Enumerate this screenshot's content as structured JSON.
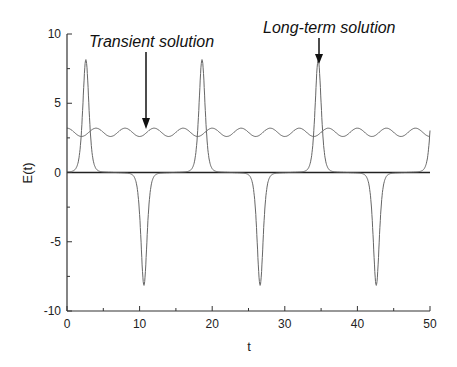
{
  "chart_data": {
    "type": "line",
    "title": "",
    "xlabel": "t",
    "ylabel": "E(t)",
    "xlim": [
      0,
      50
    ],
    "ylim": [
      -10,
      10
    ],
    "x_ticks": [
      0,
      10,
      20,
      30,
      40,
      50
    ],
    "y_ticks": [
      -10,
      -5,
      0,
      5,
      10
    ],
    "x_tick_labels": [
      "0",
      "10",
      "20",
      "30",
      "40",
      "50"
    ],
    "y_tick_labels": [
      "-10",
      "-5",
      "0",
      "5",
      "10"
    ],
    "grid": false,
    "legend": null,
    "series": [
      {
        "name": "Long-term solution",
        "description": "Periodic pulse train: sharp positive peaks (~7.9) and sharp negative troughs (~-7.9), near zero in between",
        "period": 16,
        "peaks": [
          {
            "t": 2.6,
            "E": 7.9
          },
          {
            "t": 18.6,
            "E": 7.9
          },
          {
            "t": 34.6,
            "E": 7.9
          }
        ],
        "troughs": [
          {
            "t": 10.6,
            "E": -7.9
          },
          {
            "t": 26.6,
            "E": -7.9
          },
          {
            "t": 42.6,
            "E": -7.9
          }
        ],
        "end_value": {
          "t": 50,
          "E": 7.0
        }
      },
      {
        "name": "Transient solution",
        "description": "Small sinusoidal oscillation around ~2.9 with amplitude ~0.3",
        "mean": 2.9,
        "amplitude": 0.3,
        "period": 4,
        "start_value": {
          "t": 0,
          "E": 3.2
        }
      },
      {
        "name": "Zero line",
        "description": "Horizontal baseline at E=0",
        "value": 0
      }
    ],
    "annotations": [
      {
        "text": "Transient solution",
        "arrow_to": {
          "t": 11,
          "E": 3.2
        }
      },
      {
        "text": "Long-term solution",
        "arrow_to": {
          "t": 34.6,
          "E": 7.9
        }
      }
    ]
  }
}
